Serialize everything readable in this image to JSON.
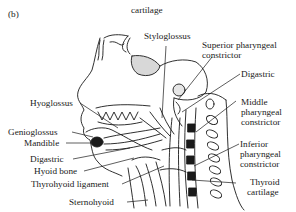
{
  "figure": {
    "panel_label": "(b)",
    "top_caption": "cartilage"
  },
  "labels": {
    "styloglossus": "Styloglossus",
    "superior_pharyngeal_1": "Superior pharyngeal",
    "superior_pharyngeal_2": "constrictor",
    "digastric_right": "Digastric",
    "middle_pharyngeal_1": "Middle",
    "middle_pharyngeal_2": "pharyngeal",
    "middle_pharyngeal_3": "constrictor",
    "inferior_pharyngeal_1": "Inferior",
    "inferior_pharyngeal_2": "pharyngeal",
    "inferior_pharyngeal_3": "constrictor",
    "thyroid_1": "Thyroid",
    "thyroid_2": "cartilage",
    "hyoglossus": "Hyoglossus",
    "genioglossus": "Genioglossus",
    "mandible": "Mandible",
    "digastric_left": "Digastric",
    "hyoid_bone": "Hyoid bone",
    "thyrohyoid_ligament": "Thyrohyoid ligament",
    "sternohyoid": "Sternohyoid"
  },
  "colors": {
    "line": "#1a1a1a",
    "shade": "#d8d8d8",
    "background": "#ffffff"
  }
}
